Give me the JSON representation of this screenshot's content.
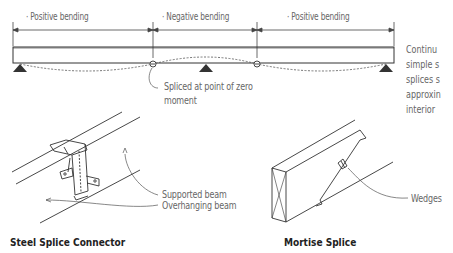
{
  "top_diagram": {
    "bending_zones": [
      {
        "label": "Positive bending"
      },
      {
        "label": "Negative bending"
      },
      {
        "label": "Positive bending"
      }
    ],
    "splice_note": {
      "line1": "Spliced at point of zero",
      "line2": "moment"
    }
  },
  "side_text": {
    "lines": [
      "Continu",
      "simple s",
      "splices s",
      "approxin",
      "interior"
    ]
  },
  "steel_splice": {
    "caption": "Steel Splice Connector",
    "callouts": {
      "supported": "Supported beam",
      "overhanging": "Overhanging beam"
    }
  },
  "mortise_splice": {
    "caption": "Mortise Splice",
    "callouts": {
      "wedges": "Wedges"
    }
  },
  "colors": {
    "line": "#333333",
    "text": "#666666",
    "support": "#333333"
  }
}
